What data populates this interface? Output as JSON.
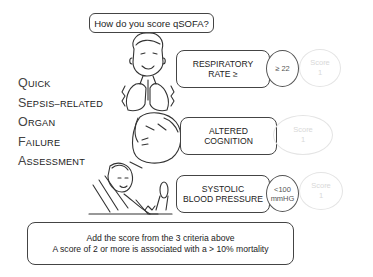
{
  "title": "How do you score qSOFA?",
  "acronym": [
    {
      "initial": "Q",
      "rest": "UICK"
    },
    {
      "initial": "S",
      "rest": "EPSIS–RELATED"
    },
    {
      "initial": "O",
      "rest": "RGAN"
    },
    {
      "initial": "F",
      "rest": "AILURE"
    },
    {
      "initial": "A",
      "rest": "SSESSMENT"
    }
  ],
  "criteria": [
    {
      "line1": "RESPIRATORY",
      "line2": "RATE ≥",
      "threshold_line1": "≥ 22",
      "threshold_line2": "",
      "score_label": "Score",
      "score_value": "1"
    },
    {
      "line1": "ALTERED",
      "line2": "COGNITION",
      "threshold_line1": "",
      "threshold_line2": "",
      "score_label": "Score",
      "score_value": "1"
    },
    {
      "line1": "SYSTOLIC",
      "line2": "BLOOD PRESSURE",
      "threshold_line1": "<100",
      "threshold_line2": "mmHG",
      "score_label": "Score",
      "score_value": "1"
    }
  ],
  "summary": {
    "line1": "Add the score from the 3 criteria above",
    "line2": "A score of 2 or more is associated with a > 10% mortality"
  },
  "illustrations": [
    "patient-breathing-icon",
    "patient-confused-icon",
    "patient-blood-pressure-icon"
  ]
}
